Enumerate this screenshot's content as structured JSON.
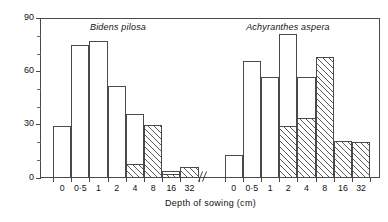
{
  "chart_data": {
    "type": "bar",
    "title": "",
    "xlabel": "Depth of sowing (cm)",
    "ylabel": "Seeds germinating and emerging (%)",
    "ylim": [
      0,
      90
    ],
    "yticks": [
      0,
      30,
      60,
      90
    ],
    "yticks_minor": [
      10,
      20,
      40,
      50,
      70,
      80
    ],
    "ytick_labels": [
      "0",
      "30",
      "60",
      "90"
    ],
    "grid": false,
    "legend": "none",
    "axis_break": "//",
    "categories": [
      "0",
      "0·5",
      "1",
      "2",
      "4",
      "8",
      "16",
      "32"
    ],
    "panels": [
      {
        "name": "Bidens pilosa",
        "title": "Bidens pilosa",
        "series": [
          {
            "name": "germinating (open)",
            "style": "open",
            "values": [
              29,
              75,
              77,
              52,
              36,
              30,
              4,
              6
            ]
          },
          {
            "name": "emerging (hatched)",
            "style": "hatched",
            "values": [
              0,
              0,
              0,
              0,
              8,
              30,
              2,
              6
            ]
          }
        ]
      },
      {
        "name": "Achyranthes aspera",
        "title": "Achyranthes aspera",
        "series": [
          {
            "name": "germinating (open)",
            "style": "open",
            "values": [
              13,
              66,
              57,
              81,
              57,
              68,
              21,
              20
            ]
          },
          {
            "name": "emerging (hatched)",
            "style": "hatched",
            "values": [
              0,
              0,
              0,
              29,
              34,
              68,
              21,
              20
            ]
          }
        ]
      }
    ]
  },
  "axis": {
    "y_title": "Seeds germinating and emerging (%)",
    "x_title": "Depth of sowing (cm)",
    "y_labels": [
      "90",
      "60",
      "30",
      "0"
    ],
    "x_labels_left": [
      "0",
      "0·5",
      "1",
      "2",
      "4",
      "8",
      "16",
      "32"
    ],
    "x_labels_right": [
      "0",
      "0·5",
      "1",
      "2",
      "4",
      "8",
      "16",
      "32"
    ],
    "break_symbol": "//"
  },
  "panel_titles": {
    "left": "Bidens pilosa",
    "right": "Achyranthes aspera"
  },
  "colors": {
    "axis": "#4a4a4a",
    "bar_line": "#4a4a4a",
    "bar_fill": "#ffffff",
    "hatch": "#5a5a5a",
    "text": "#111111",
    "background": "#ffffff"
  }
}
